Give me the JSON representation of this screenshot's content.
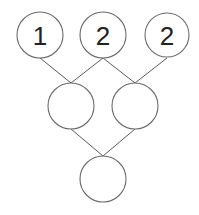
{
  "diagram": {
    "type": "binary-merge-tree",
    "colors": {
      "stroke": "#6a6a6a",
      "text": "#222222",
      "background": "#ffffff"
    },
    "nodes": [
      {
        "id": "top-left",
        "label": "1",
        "cx": 40,
        "cy": 35,
        "r": 23
      },
      {
        "id": "top-middle",
        "label": "2",
        "cx": 103,
        "cy": 35,
        "r": 23
      },
      {
        "id": "top-right",
        "label": "2",
        "cx": 167,
        "cy": 35,
        "r": 23
      },
      {
        "id": "middle-left",
        "label": "",
        "cx": 71,
        "cy": 106,
        "r": 23
      },
      {
        "id": "middle-right",
        "label": "",
        "cx": 135,
        "cy": 106,
        "r": 23
      },
      {
        "id": "bottom",
        "label": "",
        "cx": 103,
        "cy": 179,
        "r": 23
      }
    ],
    "edges": [
      {
        "from": "top-left",
        "to": "middle-left"
      },
      {
        "from": "top-middle",
        "to": "middle-left"
      },
      {
        "from": "top-middle",
        "to": "middle-right"
      },
      {
        "from": "top-right",
        "to": "middle-right"
      },
      {
        "from": "middle-left",
        "to": "bottom"
      },
      {
        "from": "middle-right",
        "to": "bottom"
      }
    ]
  }
}
